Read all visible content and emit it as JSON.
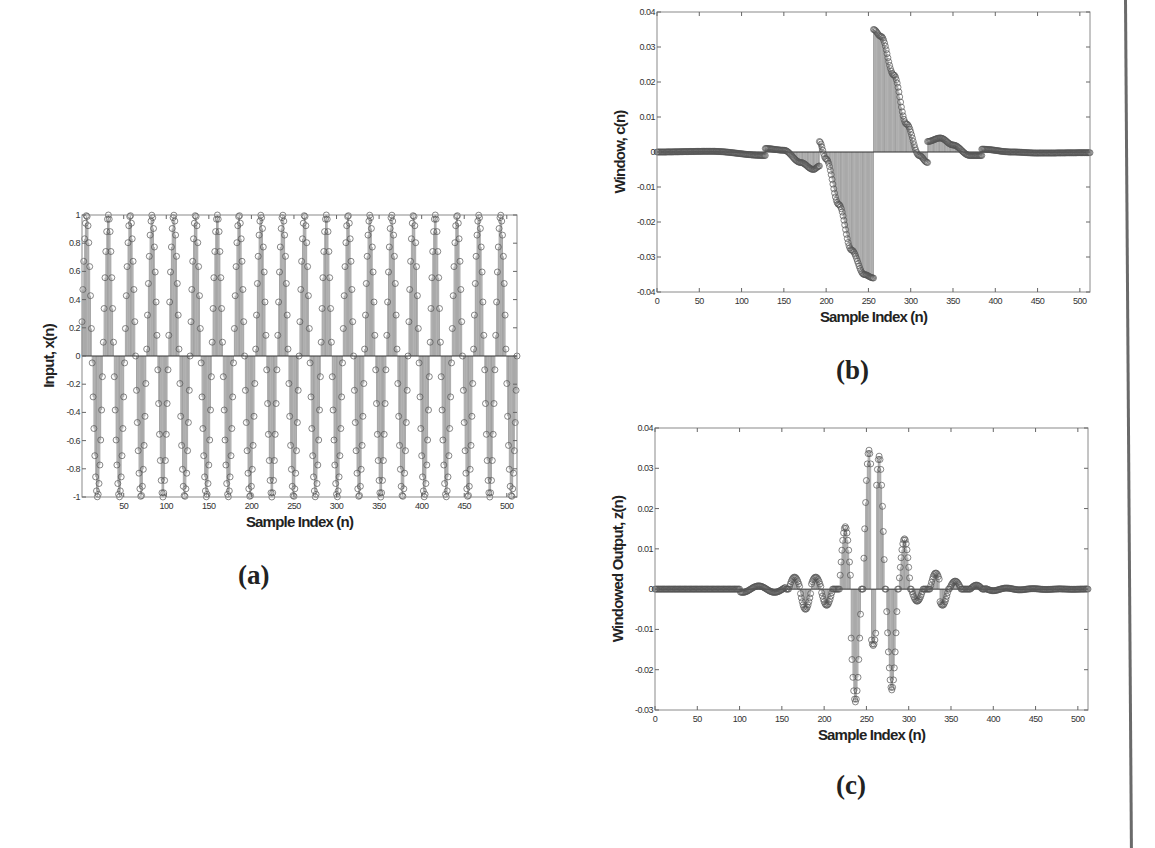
{
  "captions": {
    "a": "(a)",
    "b": "(b)",
    "c": "(c)"
  },
  "chart_data": [
    {
      "id": "a",
      "type": "stem",
      "title": "",
      "xlabel": "Sample Index (n)",
      "ylabel": "Input, x(n)",
      "xlim": [
        1,
        512
      ],
      "ylim": [
        -1,
        1
      ],
      "xticks": [
        50,
        100,
        150,
        200,
        250,
        300,
        350,
        400,
        450,
        500
      ],
      "yticks": [
        -1,
        -0.8,
        -0.6,
        -0.4,
        -0.2,
        0,
        0.2,
        0.4,
        0.6,
        0.8,
        1
      ],
      "ytick_labels": [
        "-1",
        "-0.8",
        "-0.6",
        "-0.4",
        "-0.2",
        "0",
        "0.2",
        "0.4",
        "0.6",
        "0.8",
        "1"
      ],
      "grid": false,
      "marker": "circle",
      "signal": {
        "kind": "periodic-sine",
        "length": 512,
        "cycles": 20,
        "amplitude": 1
      },
      "box": {
        "left": 82,
        "top": 215,
        "right": 517,
        "bottom": 497
      }
    },
    {
      "id": "b",
      "type": "stem",
      "title": "",
      "xlabel": "Sample Index (n)",
      "ylabel": "Window, c(n)",
      "xlim": [
        0,
        512
      ],
      "ylim": [
        -0.04,
        0.04
      ],
      "xticks": [
        0,
        50,
        100,
        150,
        200,
        250,
        300,
        350,
        400,
        450,
        500
      ],
      "yticks": [
        -0.04,
        -0.03,
        -0.02,
        -0.01,
        0,
        0.01,
        0.02,
        0.03,
        0.04
      ],
      "ytick_labels": [
        "-0.04",
        "-0.03",
        "-0.02",
        "-0.01",
        "0",
        "0.01",
        "0.02",
        "0.03",
        "0.04"
      ],
      "grid": false,
      "marker": "circle",
      "segments": [
        {
          "x": [
            0,
            64,
            128
          ],
          "y": [
            0,
            0.0002,
            -0.001
          ]
        },
        {
          "x": [
            128,
            150,
            170,
            185,
            192
          ],
          "y": [
            0.001,
            0.0005,
            -0.003,
            -0.005,
            -0.004
          ]
        },
        {
          "x": [
            192,
            200,
            215,
            230,
            245,
            256
          ],
          "y": [
            0.003,
            -0.002,
            -0.015,
            -0.028,
            -0.035,
            -0.036
          ]
        },
        {
          "x": [
            256,
            265,
            280,
            295,
            310,
            320
          ],
          "y": [
            0.035,
            0.033,
            0.022,
            0.008,
            -0.001,
            -0.003
          ]
        },
        {
          "x": [
            320,
            335,
            350,
            370,
            384
          ],
          "y": [
            0.003,
            0.004,
            0.002,
            -0.001,
            -0.001
          ]
        },
        {
          "x": [
            384,
            420,
            450,
            512
          ],
          "y": [
            0.0008,
            0.0,
            -0.0003,
            -0.0002
          ]
        }
      ],
      "box": {
        "left": 657,
        "top": 12,
        "right": 1090,
        "bottom": 292
      }
    },
    {
      "id": "c",
      "type": "stem",
      "title": "",
      "xlabel": "Sample Index (n)",
      "ylabel": "Windowed Output, z(n)",
      "xlim": [
        0,
        512
      ],
      "ylim": [
        -0.03,
        0.04
      ],
      "xticks": [
        0,
        50,
        100,
        150,
        200,
        250,
        300,
        350,
        400,
        450,
        500
      ],
      "yticks": [
        -0.03,
        -0.02,
        -0.01,
        0,
        0.01,
        0.02,
        0.03,
        0.04
      ],
      "ytick_labels": [
        "-0.03",
        "-0.02",
        "-0.01",
        "0",
        "0.01",
        "0.02",
        "0.03",
        "0.04"
      ],
      "grid": false,
      "marker": "circle",
      "envelope_peaks": [
        {
          "x": 165,
          "y": 0.003
        },
        {
          "x": 178,
          "y": -0.005
        },
        {
          "x": 190,
          "y": 0.003
        },
        {
          "x": 203,
          "y": -0.004
        },
        {
          "x": 225,
          "y": 0.0155
        },
        {
          "x": 237,
          "y": -0.028
        },
        {
          "x": 253,
          "y": 0.0345
        },
        {
          "x": 258,
          "y": -0.014
        },
        {
          "x": 265,
          "y": 0.033
        },
        {
          "x": 280,
          "y": -0.025
        },
        {
          "x": 295,
          "y": 0.0125
        },
        {
          "x": 310,
          "y": -0.003
        },
        {
          "x": 332,
          "y": 0.004
        },
        {
          "x": 340,
          "y": -0.004
        },
        {
          "x": 355,
          "y": 0.002
        },
        {
          "x": 380,
          "y": 0.001
        }
      ],
      "box": {
        "left": 655,
        "top": 428,
        "right": 1088,
        "bottom": 710
      }
    }
  ]
}
